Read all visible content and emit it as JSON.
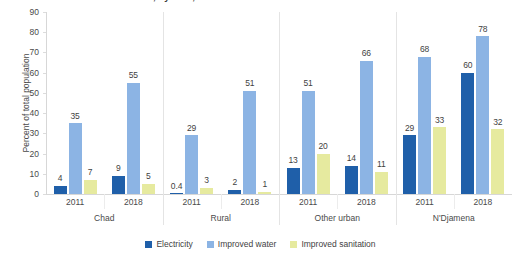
{
  "chart_data": {
    "type": "bar",
    "title": "Access to basic services, by area, 2011 and 2018",
    "xlabel": "",
    "ylabel": "Percent of total population",
    "ylim": [
      0,
      90
    ],
    "ytick_step": 10,
    "yticks": [
      90,
      80,
      70,
      60,
      50,
      40,
      30,
      20,
      10,
      0
    ],
    "grid": false,
    "legend_position": "bottom",
    "groups": [
      "Chad",
      "Rural",
      "Other urban",
      "N'Djamena"
    ],
    "periods": [
      "2011",
      "2018"
    ],
    "categories": [
      "Chad 2011",
      "Chad 2018",
      "Rural 2011",
      "Rural 2018",
      "Other urban 2011",
      "Other urban 2018",
      "N'Djamena 2011",
      "N'Djamena 2018"
    ],
    "series": [
      {
        "name": "Electricity",
        "color": "#1f5fa9",
        "values": [
          4,
          9,
          0.4,
          2,
          13,
          14,
          29,
          60
        ],
        "labels": [
          "4",
          "9",
          "0.4",
          "2",
          "13",
          "14",
          "29",
          "60"
        ]
      },
      {
        "name": "Improved water",
        "color": "#8cb4e4",
        "values": [
          35,
          55,
          29,
          51,
          51,
          66,
          68,
          78
        ],
        "labels": [
          "35",
          "55",
          "29",
          "51",
          "51",
          "66",
          "68",
          "78"
        ]
      },
      {
        "name": "Improved sanitation",
        "color": "#e6ea9f",
        "values": [
          7,
          5,
          3,
          1,
          20,
          11,
          33,
          32
        ],
        "labels": [
          "7",
          "5",
          "3",
          "1",
          "20",
          "11",
          "33",
          "32"
        ]
      }
    ]
  }
}
